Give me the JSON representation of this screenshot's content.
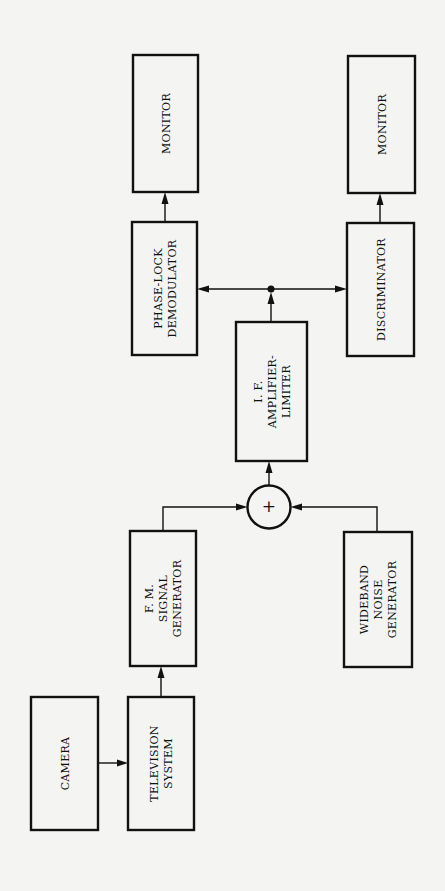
{
  "diagram": {
    "orientation": "rotated 90° counter-clockwise",
    "blocks": {
      "camera": [
        "CAMERA"
      ],
      "television_system": [
        "TELEVISION",
        "SYSTEM"
      ],
      "fm_signal_generator": [
        "F. M.",
        "SIGNAL",
        "GENERATOR"
      ],
      "wideband_noise_generator": [
        "WIDEBAND",
        "NOISE",
        "GENERATOR"
      ],
      "summer": "+",
      "if_amplifier_limiter": [
        "I. F.",
        "AMPLIFIER-",
        "LIMITER"
      ],
      "phase_lock_demodulator": [
        "PHASE-LOCK",
        "DEMODULATOR"
      ],
      "discriminator": [
        "DISCRIMINATOR"
      ],
      "monitor_1": [
        "MONITOR"
      ],
      "monitor_2": [
        "MONITOR"
      ]
    },
    "connections": [
      {
        "from": "camera",
        "to": "television_system"
      },
      {
        "from": "television_system",
        "to": "fm_signal_generator"
      },
      {
        "from": "fm_signal_generator",
        "to": "summer"
      },
      {
        "from": "wideband_noise_generator",
        "to": "summer"
      },
      {
        "from": "summer",
        "to": "if_amplifier_limiter"
      },
      {
        "from": "if_amplifier_limiter",
        "to": "phase_lock_demodulator"
      },
      {
        "from": "if_amplifier_limiter",
        "to": "discriminator"
      },
      {
        "from": "phase_lock_demodulator",
        "to": "monitor_1"
      },
      {
        "from": "discriminator",
        "to": "monitor_2"
      }
    ]
  }
}
